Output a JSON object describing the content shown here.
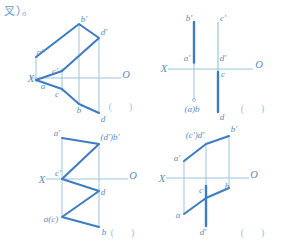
{
  "page": {
    "header_note": "叉）。",
    "stroke_heavy": "#3f7cc0",
    "stroke_light": "#9cc3e0",
    "text_color": "#5a8cc0",
    "background": "#ffffff",
    "answer_blank": "(        )"
  },
  "figures": [
    {
      "id": "figure-1",
      "position": "top-left",
      "axis": {
        "x_label": "X",
        "o_label": "O"
      },
      "labels": [
        {
          "name": "b-prime",
          "text": "b'",
          "x": 84,
          "y": 19
        },
        {
          "name": "d-prime",
          "text": "d'",
          "x": 104,
          "y": 32
        },
        {
          "name": "a-prime",
          "text": "a'",
          "x": 40,
          "y": 52
        },
        {
          "name": "c-prime",
          "text": "c'",
          "x": 55,
          "y": 71
        },
        {
          "name": "a-lower",
          "text": "a",
          "x": 43,
          "y": 86
        },
        {
          "name": "c-lower",
          "text": "c",
          "x": 57,
          "y": 94
        },
        {
          "name": "b-lower",
          "text": "b",
          "x": 79,
          "y": 110
        },
        {
          "name": "d-lower",
          "text": "d",
          "x": 103,
          "y": 119
        }
      ],
      "answer_blank": "(        )"
    },
    {
      "id": "figure-2",
      "position": "top-right",
      "axis": {
        "x_label": "X",
        "o_label": "O"
      },
      "labels": [
        {
          "name": "b-prime",
          "text": "b'",
          "x": 45,
          "y": 18
        },
        {
          "name": "c-prime",
          "text": "c'",
          "x": 79,
          "y": 18
        },
        {
          "name": "a-prime",
          "text": "a'",
          "x": 43,
          "y": 58
        },
        {
          "name": "d-prime",
          "text": "d'",
          "x": 79,
          "y": 58
        },
        {
          "name": "c-lower",
          "text": "c",
          "x": 79,
          "y": 74
        },
        {
          "name": "ab-coincident",
          "text": "(a)b",
          "x": 48,
          "y": 109
        },
        {
          "name": "d-lower",
          "text": "d",
          "x": 78,
          "y": 117
        }
      ],
      "answer_blank": "(        )"
    },
    {
      "id": "figure-3",
      "position": "bottom-left",
      "axis": {
        "x_label": "X",
        "o_label": "O"
      },
      "labels": [
        {
          "name": "a-prime",
          "text": "a'",
          "x": 57,
          "y": 11
        },
        {
          "name": "db-prime-coincident",
          "text": "(d')b'",
          "x": 103,
          "y": 15
        },
        {
          "name": "c-prime",
          "text": "c'",
          "x": 58,
          "y": 51
        },
        {
          "name": "d-lower",
          "text": "d",
          "x": 101,
          "y": 70
        },
        {
          "name": "ac-coincident",
          "text": "a(c)",
          "x": 51,
          "y": 97
        },
        {
          "name": "b-lower",
          "text": "b",
          "x": 103,
          "y": 110
        }
      ],
      "answer_blank": "(        )"
    },
    {
      "id": "figure-4",
      "position": "bottom-right",
      "axis": {
        "x_label": "X",
        "o_label": "O"
      },
      "labels": [
        {
          "name": "cd-prime-coincident",
          "text": "(c')d'",
          "x": 51,
          "y": 13
        },
        {
          "name": "b-prime",
          "text": "b'",
          "x": 100,
          "y": 7
        },
        {
          "name": "a-prime",
          "text": "a'",
          "x": 33,
          "y": 36
        },
        {
          "name": "c-lower",
          "text": "c",
          "x": 57,
          "y": 68
        },
        {
          "name": "b-lower",
          "text": "b",
          "x": 83,
          "y": 64
        },
        {
          "name": "a-lower",
          "text": "a",
          "x": 34,
          "y": 93
        },
        {
          "name": "d-prime-low",
          "text": "d'",
          "x": 59,
          "y": 110
        }
      ],
      "answer_blank": "(        )"
    }
  ]
}
